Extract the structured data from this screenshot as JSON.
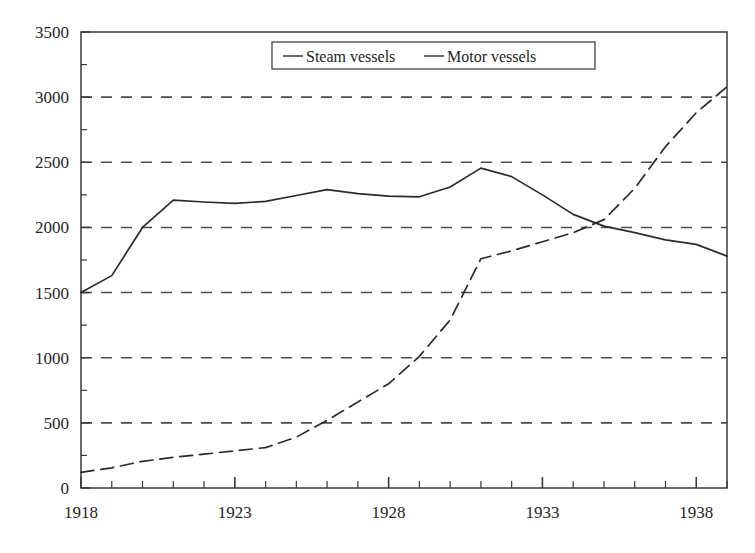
{
  "chart_data": {
    "type": "line",
    "title": "",
    "subtitle": "",
    "xlabel": "",
    "ylabel": "",
    "xlim": [
      1918,
      1939
    ],
    "ylim": [
      0,
      3500
    ],
    "yticks": [
      0,
      500,
      1000,
      1500,
      2000,
      2500,
      3000,
      3500
    ],
    "ytick_labels": [
      "0",
      "500",
      "1000",
      "1500",
      "2000",
      "2500",
      "3000",
      "3500"
    ],
    "xticks": [
      1918,
      1919,
      1920,
      1921,
      1922,
      1923,
      1924,
      1925,
      1926,
      1927,
      1928,
      1929,
      1930,
      1931,
      1932,
      1933,
      1934,
      1935,
      1936,
      1937,
      1938,
      1939
    ],
    "xtick_labels_shown": [
      "1918",
      "1923",
      "1928",
      "1933",
      "1938"
    ],
    "xtick_labels_shown_at": [
      1918,
      1923,
      1928,
      1933,
      1938
    ],
    "grid": {
      "horizontal": true,
      "vertical": false,
      "style": "dashed",
      "color": "#4d4d4d"
    },
    "legend": {
      "position": "top-center",
      "border": true,
      "entries": [
        "Steam vessels",
        "Motor vessels"
      ]
    },
    "x": [
      1918,
      1919,
      1920,
      1921,
      1922,
      1923,
      1924,
      1925,
      1926,
      1927,
      1928,
      1929,
      1930,
      1931,
      1932,
      1933,
      1934,
      1935,
      1936,
      1937,
      1938,
      1939
    ],
    "series": [
      {
        "name": "Steam vessels",
        "style": "solid",
        "color": "#2b2b2b",
        "values": [
          1500,
          1630,
          2000,
          2210,
          2195,
          2185,
          2200,
          2245,
          2290,
          2260,
          2240,
          2235,
          2310,
          2455,
          2390,
          2250,
          2100,
          2010,
          1960,
          1905,
          1870,
          1780
        ]
      },
      {
        "name": "Motor vessels",
        "style": "dashed",
        "color": "#2b2b2b",
        "values": [
          120,
          155,
          205,
          235,
          260,
          285,
          310,
          390,
          520,
          660,
          800,
          1010,
          1290,
          1760,
          1820,
          1890,
          1960,
          2060,
          2300,
          2620,
          2880,
          3080
        ]
      }
    ]
  },
  "legend": {
    "steam_label": "Steam vessels",
    "motor_label": "Motor vessels"
  },
  "axes": {
    "y_labels": [
      "3500",
      "3000",
      "2500",
      "2000",
      "1500",
      "1000",
      "500",
      "0"
    ],
    "x_labels": [
      "1918",
      "1923",
      "1928",
      "1933",
      "1938"
    ]
  }
}
